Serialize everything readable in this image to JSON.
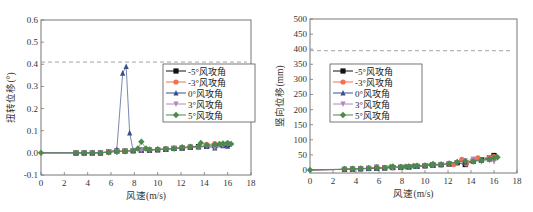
{
  "chart_data": [
    {
      "type": "line",
      "title": "",
      "xlabel": "风速(m/s)",
      "ylabel": "扭转位移(°)",
      "xlim": [
        0,
        18
      ],
      "ylim": [
        -0.1,
        0.6
      ],
      "xticks": [
        0,
        2,
        4,
        6,
        8,
        10,
        12,
        14,
        16,
        18
      ],
      "yticks": [
        -0.1,
        0.0,
        0.1,
        0.2,
        0.3,
        0.4,
        0.5,
        0.6
      ],
      "ytick_labels": [
        "-0.1",
        "0.0",
        "0.1",
        "0.2",
        "0.3",
        "0.4",
        "0.5",
        "0.6"
      ],
      "grid": false,
      "legend_position": "right-middle",
      "reference_line": {
        "y": 0.41,
        "style": "dashed",
        "color": "#999999"
      },
      "series": [
        {
          "name": "-5°风攻角",
          "color": "#111111",
          "marker": "square",
          "x": [
            0,
            3,
            3.7,
            4.4,
            5.1,
            5.8,
            6.5,
            7.2,
            7.9,
            8.6,
            9.3,
            10,
            10.7,
            11.4,
            12.1,
            12.8,
            13.5,
            14.2,
            14.9,
            15.6,
            16
          ],
          "y": [
            0,
            0,
            0,
            0,
            0,
            0.005,
            0.008,
            0.008,
            0.01,
            0.012,
            0.012,
            0.014,
            0.016,
            0.02,
            0.022,
            0.025,
            0.028,
            0.03,
            0.032,
            0.035,
            0.038
          ]
        },
        {
          "name": "-3°风攻角",
          "color": "#f07050",
          "marker": "circle",
          "x": [
            0,
            3,
            3.7,
            4.4,
            5.1,
            5.8,
            6.5,
            7.2,
            7.9,
            8.6,
            9.3,
            10,
            10.7,
            11.4,
            12.1,
            12.8,
            13.5,
            14.2,
            14.9,
            15.6,
            16
          ],
          "y": [
            0,
            0,
            0,
            0,
            0,
            0.004,
            0.006,
            0.008,
            0.01,
            0.012,
            0.013,
            0.015,
            0.017,
            0.02,
            0.023,
            0.028,
            0.025,
            0.038,
            0.042,
            0.035,
            0.04
          ]
        },
        {
          "name": "0°风攻角",
          "color": "#3b4e8c",
          "marker": "triangle-up",
          "x": [
            0,
            3,
            3.7,
            4.4,
            5.1,
            5.8,
            6.5,
            7.0,
            7.3,
            7.6,
            7.9,
            8.6,
            9.3,
            10,
            10.7,
            11.4,
            12.1,
            12.8,
            13.5,
            14.2,
            14.9,
            15.6,
            16
          ],
          "y": [
            0,
            0,
            0,
            0,
            0,
            0.005,
            0.015,
            0.36,
            0.39,
            0.09,
            0.01,
            0.012,
            0.013,
            0.015,
            0.017,
            0.02,
            0.022,
            0.025,
            0.028,
            0.03,
            0.022,
            0.032,
            0.03
          ]
        },
        {
          "name": "3°风攻角",
          "color": "#b08ab8",
          "marker": "triangle-down",
          "x": [
            0,
            3,
            3.7,
            4.4,
            5.1,
            5.8,
            6.5,
            7.2,
            7.9,
            8.6,
            9.3,
            10,
            10.7,
            11.4,
            12.1,
            12.8,
            13.5,
            14.2,
            14.9,
            15.6,
            16
          ],
          "y": [
            0,
            0,
            0,
            0,
            0,
            0.004,
            0.006,
            0.008,
            0.01,
            0.012,
            0.013,
            0.015,
            0.017,
            0.02,
            0.023,
            0.026,
            0.024,
            0.03,
            0.025,
            0.035,
            0.04
          ]
        },
        {
          "name": "5°风攻角",
          "color": "#4a8a4a",
          "marker": "diamond",
          "x": [
            0,
            3,
            3.7,
            4.4,
            5.1,
            5.8,
            6.5,
            7.2,
            7.9,
            8.3,
            8.6,
            9.0,
            9.3,
            10,
            10.7,
            11.4,
            12.1,
            12.8,
            13.5,
            13.7,
            14.2,
            14.9,
            15.3,
            15.6,
            16,
            16.3
          ],
          "y": [
            0,
            0,
            0,
            0,
            0,
            0.003,
            0.005,
            0.007,
            0.01,
            0.02,
            0.05,
            0.02,
            0.015,
            0.016,
            0.018,
            0.02,
            0.025,
            0.028,
            0.03,
            0.045,
            0.035,
            0.038,
            0.04,
            0.042,
            0.045,
            0.04
          ]
        }
      ]
    },
    {
      "type": "line",
      "title": "",
      "xlabel": "风速(m/s)",
      "ylabel": "竖向位移(mm)",
      "xlim": [
        0,
        18
      ],
      "ylim": [
        -10,
        500
      ],
      "xticks": [
        0,
        2,
        4,
        6,
        8,
        10,
        12,
        14,
        16,
        18
      ],
      "yticks": [
        0,
        50,
        100,
        150,
        200,
        250,
        300,
        350,
        400,
        450,
        500
      ],
      "ytick_labels": [
        "0",
        "50",
        "100",
        "150",
        "200",
        "250",
        "300",
        "350",
        "400",
        "450",
        "500"
      ],
      "grid": false,
      "legend_position": "left-middle",
      "reference_line": {
        "y": 395,
        "style": "dashed",
        "color": "#999999"
      },
      "series": [
        {
          "name": "-5°风攻角",
          "color": "#111111",
          "marker": "square",
          "x": [
            0,
            3,
            3.7,
            4.4,
            5.1,
            5.8,
            6.5,
            7.2,
            7.9,
            8.6,
            9.3,
            10,
            10.7,
            11.4,
            12.1,
            12.8,
            13.5,
            14.2,
            14.9,
            15.6,
            16
          ],
          "y": [
            0,
            2,
            3,
            4,
            5,
            6,
            7,
            8,
            9,
            10,
            12,
            14,
            16,
            18,
            20,
            24,
            18,
            30,
            34,
            40,
            48
          ]
        },
        {
          "name": "-3°风攻角",
          "color": "#f07050",
          "marker": "circle",
          "x": [
            0,
            3,
            3.7,
            4.4,
            5.1,
            5.8,
            6.5,
            7.2,
            7.9,
            8.6,
            9.3,
            10,
            10.7,
            11.4,
            12.1,
            12.5,
            13.2,
            13.6,
            14.2,
            14.6,
            15.6,
            16
          ],
          "y": [
            0,
            2,
            3,
            4,
            5,
            6,
            7,
            8,
            9,
            10,
            12,
            14,
            16,
            18,
            20,
            18,
            35,
            20,
            32,
            40,
            42,
            44
          ]
        },
        {
          "name": "0°风攻角",
          "color": "#3b4e8c",
          "marker": "triangle-up",
          "x": [
            0,
            3,
            3.7,
            4.4,
            5.1,
            5.8,
            6.5,
            7.2,
            7.9,
            8.6,
            9.3,
            10,
            10.7,
            11.4,
            12.1,
            12.8,
            13.5,
            14.2,
            14.9,
            15.6,
            16
          ],
          "y": [
            0,
            2,
            3,
            4,
            5,
            6,
            7,
            9,
            10,
            11,
            12,
            14,
            16,
            18,
            20,
            28,
            26,
            30,
            32,
            36,
            38
          ]
        },
        {
          "name": "3°风攻角",
          "color": "#b08ab8",
          "marker": "triangle-down",
          "x": [
            0,
            3,
            3.7,
            4.4,
            5.1,
            5.8,
            6.5,
            7.2,
            7.9,
            8.6,
            9.3,
            10,
            10.7,
            11.4,
            12.1,
            12.8,
            13.5,
            14.2,
            14.9,
            15.6,
            16
          ],
          "y": [
            0,
            2,
            3,
            4,
            5,
            10,
            7,
            8,
            9,
            10,
            12,
            14,
            16,
            18,
            20,
            24,
            30,
            36,
            28,
            32,
            28
          ]
        },
        {
          "name": "5°风攻角",
          "color": "#4a8a4a",
          "marker": "diamond",
          "x": [
            0,
            3,
            3.7,
            4.4,
            5.1,
            5.8,
            6.5,
            7.0,
            7.2,
            7.9,
            8.3,
            8.6,
            9.0,
            9.3,
            10,
            10.5,
            10.7,
            11.4,
            12.1,
            12.8,
            13.5,
            14.2,
            14.9,
            15.6,
            16,
            16.3
          ],
          "y": [
            0,
            3,
            4,
            5,
            6,
            8,
            7,
            10,
            12,
            10,
            11,
            12,
            13,
            14,
            15,
            17,
            20,
            18,
            22,
            26,
            30,
            28,
            32,
            36,
            40,
            42
          ]
        }
      ]
    }
  ]
}
